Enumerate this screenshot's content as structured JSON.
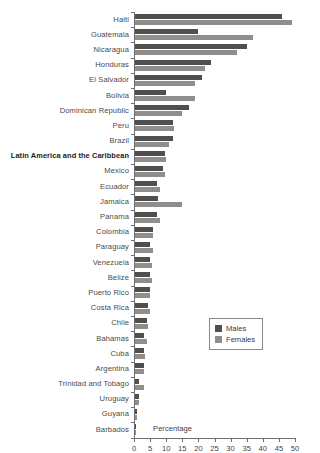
{
  "chart_data": {
    "type": "bar",
    "title": "",
    "xlabel": "Percentage",
    "ylabel": "",
    "xlim": [
      0,
      50
    ],
    "xticks": [
      0,
      5,
      10,
      15,
      20,
      25,
      30,
      35,
      40,
      45,
      50
    ],
    "grid": false,
    "orientation": "horizontal",
    "legend_position": "center-right",
    "categories": [
      "Haiti",
      "Guatemala",
      "Nicaragua",
      "Honduras",
      "El Salvador",
      "Bolivia",
      "Dominican Republic",
      "Peru",
      "Brazil",
      "Latin America and the Caribbean",
      "Mexico",
      "Ecuador",
      "Jamaica",
      "Panama",
      "Colombia",
      "Paraguay",
      "Venezuela",
      "Belize",
      "Puerto Rico",
      "Costa Rica",
      "Chile",
      "Bahamas",
      "Cuba",
      "Argentina",
      "Trinidad and Tobago",
      "Uruguay",
      "Guyana",
      "Barbados"
    ],
    "highlight_category": "Latin America and the Caribbean",
    "series": [
      {
        "name": "Males",
        "color": "#4f4f4f",
        "values": [
          46.0,
          20.0,
          35.0,
          24.0,
          21.0,
          10.0,
          17.0,
          12.0,
          12.0,
          9.5,
          9.0,
          7.0,
          7.5,
          7.0,
          6.0,
          5.0,
          5.0,
          5.0,
          5.0,
          4.5,
          4.0,
          3.0,
          3.0,
          3.0,
          1.5,
          1.5,
          1.0,
          0.5
        ]
      },
      {
        "name": "Females",
        "color": "#8e8e8e",
        "values": [
          49.0,
          37.0,
          32.0,
          22.0,
          19.0,
          19.0,
          15.0,
          12.5,
          11.0,
          10.0,
          9.5,
          8.0,
          15.0,
          8.0,
          6.0,
          6.0,
          5.5,
          5.5,
          5.0,
          5.0,
          4.5,
          4.0,
          3.5,
          3.0,
          3.0,
          1.5,
          1.0,
          0.5
        ]
      }
    ]
  },
  "legend": {
    "items": [
      {
        "label": "Males"
      },
      {
        "label": "Females"
      }
    ]
  }
}
